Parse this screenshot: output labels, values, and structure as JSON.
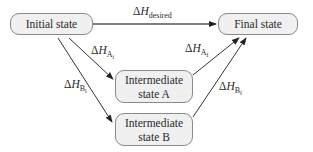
{
  "nodes": {
    "initial": {
      "label": "Initial state"
    },
    "final": {
      "label": "Final state"
    },
    "intermediate_a": {
      "line1": "Intermediate",
      "line2": "state A"
    },
    "intermediate_b": {
      "line1": "Intermediate",
      "line2": "state B"
    }
  },
  "edges": {
    "desired": {
      "delta": "Δ",
      "symbol": "H",
      "sub": "desired",
      "subsub": ""
    },
    "a_initial": {
      "delta": "Δ",
      "symbol": "H",
      "sub": "A",
      "subsub": "i"
    },
    "a_final": {
      "delta": "Δ",
      "symbol": "H",
      "sub": "A",
      "subsub": "f"
    },
    "b_initial": {
      "delta": "Δ",
      "symbol": "H",
      "sub": "B",
      "subsub": "i"
    },
    "b_final": {
      "delta": "Δ",
      "symbol": "H",
      "sub": "B",
      "subsub": "f"
    }
  },
  "colors": {
    "node_fill": "#f0f0f0",
    "node_border": "#8a8a8a",
    "arrow": "#222222"
  }
}
